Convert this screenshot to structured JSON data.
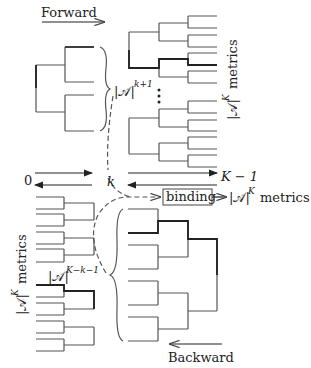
{
  "labels": {
    "forward": "Forward",
    "backward": "Backward",
    "zero": "0",
    "k": "k",
    "K_minus_1": "K − 1",
    "binding": "binding",
    "A": "|𝒜|",
    "exp_k1": "k+1",
    "exp_Kk1": "K−k−1",
    "exp_K": "K",
    "metrics": "metrics"
  },
  "colors": {
    "line": "#555555",
    "dark": "#333333"
  }
}
